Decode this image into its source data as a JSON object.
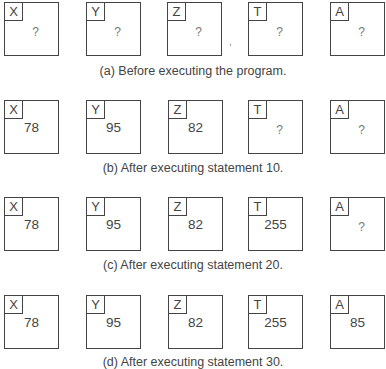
{
  "figure": {
    "variables": [
      "X",
      "Y",
      "Z",
      "T",
      "A"
    ],
    "states": [
      {
        "id": "a",
        "caption": "(a) Before executing the program.",
        "cells": [
          {
            "name": "X",
            "value": "?"
          },
          {
            "name": "Y",
            "value": "?"
          },
          {
            "name": "Z",
            "value": "?"
          },
          {
            "name": "T",
            "value": "?"
          },
          {
            "name": "A",
            "value": "?"
          }
        ]
      },
      {
        "id": "b",
        "caption": "(b) After executing statement 10.",
        "cells": [
          {
            "name": "X",
            "value": "78"
          },
          {
            "name": "Y",
            "value": "95"
          },
          {
            "name": "Z",
            "value": "82"
          },
          {
            "name": "T",
            "value": "?"
          },
          {
            "name": "A",
            "value": "?"
          }
        ]
      },
      {
        "id": "c",
        "caption": "(c) After executing statement 20.",
        "cells": [
          {
            "name": "X",
            "value": "78"
          },
          {
            "name": "Y",
            "value": "95"
          },
          {
            "name": "Z",
            "value": "82"
          },
          {
            "name": "T",
            "value": "255"
          },
          {
            "name": "A",
            "value": "?"
          }
        ]
      },
      {
        "id": "d",
        "caption": "(d) After executing statement 30.",
        "cells": [
          {
            "name": "X",
            "value": "78"
          },
          {
            "name": "Y",
            "value": "95"
          },
          {
            "name": "Z",
            "value": "82"
          },
          {
            "name": "T",
            "value": "255"
          },
          {
            "name": "A",
            "value": "85"
          }
        ]
      }
    ]
  }
}
